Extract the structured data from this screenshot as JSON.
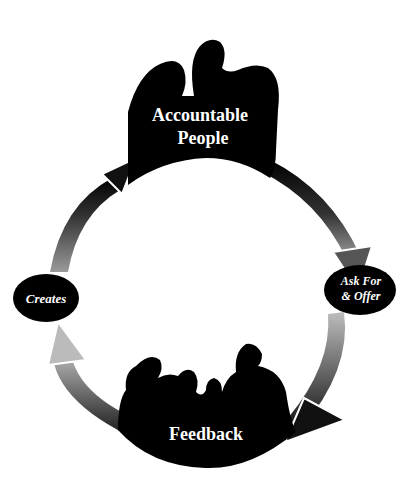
{
  "diagram": {
    "type": "cycle",
    "nodes": [
      {
        "id": "accountable-people",
        "label_line1": "Accountable",
        "label_line2": "People",
        "shape": "silhouette-two-people"
      },
      {
        "id": "ask-for-offer",
        "label_line1": "Ask For",
        "label_line2": "& Offer",
        "shape": "ellipse"
      },
      {
        "id": "feedback",
        "label": "Feedback",
        "shape": "silhouette-group"
      },
      {
        "id": "creates",
        "label": "Creates",
        "shape": "ellipse"
      }
    ],
    "edges": [
      {
        "from": "accountable-people",
        "to": "ask-for-offer"
      },
      {
        "from": "ask-for-offer",
        "to": "feedback"
      },
      {
        "from": "feedback",
        "to": "creates"
      },
      {
        "from": "creates",
        "to": "accountable-people"
      }
    ],
    "colors": {
      "dark": "#000000",
      "light": "#bfbfbf",
      "text": "#ffffff",
      "background": "#ffffff"
    }
  }
}
